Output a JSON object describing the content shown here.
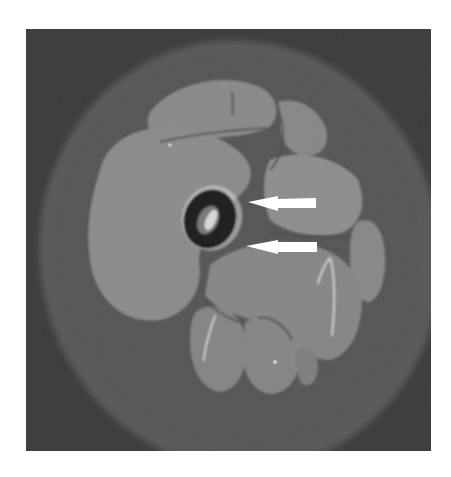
{
  "image": {
    "description": "Axial MRI cross-section of a thigh with two white arrows pointing toward the femur",
    "modality": "MRI",
    "colors": {
      "background": "#3d3d3d",
      "subcutaneous_fat": "#5e5e5e",
      "muscle": "#8a8a8a",
      "muscle_light": "#939393",
      "fascia": "#4a4a4a",
      "bone_cortex": "#1e1e1e",
      "marrow": "#cfcfcf",
      "arrow": "#ffffff"
    },
    "arrows": [
      {
        "id": "arrow-upper",
        "direction": "left",
        "tip_x": 248,
        "y": 203,
        "tail_x": 316
      },
      {
        "id": "arrow-lower",
        "direction": "left",
        "tip_x": 246,
        "y": 247,
        "tail_x": 317
      }
    ]
  }
}
